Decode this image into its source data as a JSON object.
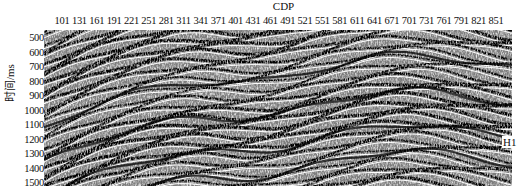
{
  "figure": {
    "x_axis": {
      "label": "CDP",
      "ticks": [
        "101",
        "131",
        "161",
        "191",
        "221",
        "251",
        "281",
        "311",
        "341",
        "371",
        "401",
        "431",
        "461",
        "491",
        "521",
        "551",
        "581",
        "611",
        "641",
        "671",
        "701",
        "731",
        "761",
        "791",
        "821",
        "851"
      ]
    },
    "y_axis": {
      "label": "时间/ms",
      "ticks": [
        "500",
        "600",
        "700",
        "800",
        "900",
        "1000",
        "1100",
        "1200",
        "1300",
        "1400",
        "1500"
      ]
    },
    "annotation": {
      "label": "H1"
    },
    "colors": {
      "background": "#ffffff",
      "text": "#111111",
      "trace_dark": "#000000",
      "trace_light": "#ffffff"
    }
  }
}
